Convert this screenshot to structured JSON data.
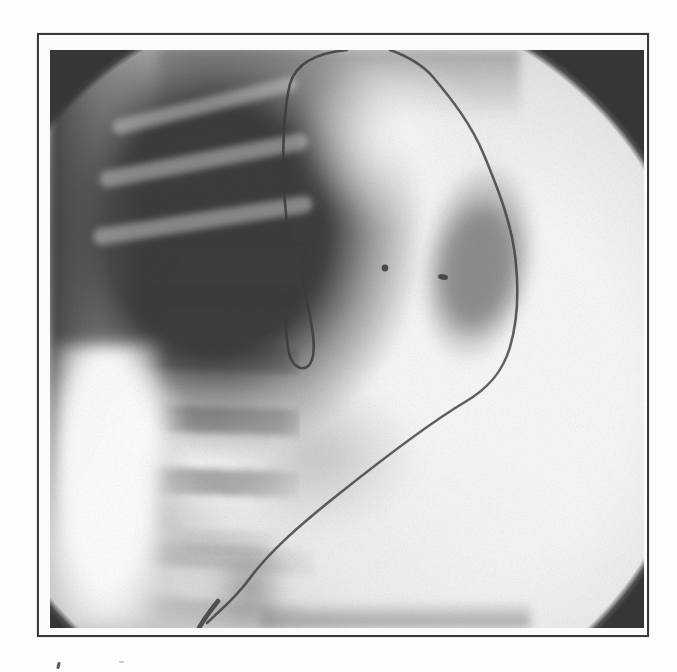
{
  "page": {
    "background_color": "#fdfdfd",
    "content": "Scanned book/figure page containing a single framed radiographic image, no visible caption text (only the clipped tops of a caption remain below the frame)"
  },
  "figure": {
    "modality": "fluoroscopic X-ray (abdominal radiograph)",
    "frame": {
      "border_color": "#3a3a3a",
      "matte_color": "#fbfbfa"
    },
    "field": {
      "shape": "circle",
      "base_tone": "#cbcbc9",
      "corner_tone": "#373737",
      "highlight_tone": "#fafaf8"
    },
    "features": {
      "catheter_color": "#3c3c3c",
      "catheter_loop": "small kinked loop over mid-spine",
      "catheter_tip": "thickened dark tip at bottom left of field",
      "marker_dots": [
        {
          "approx_position": "center field, left dot"
        },
        {
          "approx_position": "center field, right dot at edge of contrast blob"
        }
      ],
      "kidney_blob_tone": "#949492",
      "dark_mass_tone": "#383838",
      "spine_light_tone": "#f6f6f4",
      "spine_disc_tone": "#949492"
    },
    "caption_remnant": "tops of cropped caption letters visible below lower-left corner of frame"
  }
}
